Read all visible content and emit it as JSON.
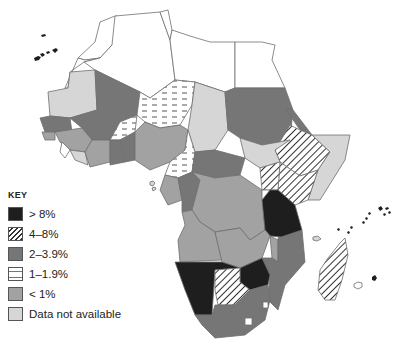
{
  "legend": {
    "title": "KEY",
    "items": [
      {
        "label": "> 8%",
        "pattern": "solid",
        "color": "#1e1e1e"
      },
      {
        "label": "4–8%",
        "pattern": "diagonal-hatch",
        "color": "#ffffff"
      },
      {
        "label": "2–3.9%",
        "pattern": "solid",
        "color": "#767676"
      },
      {
        "label": "1–1.9%",
        "pattern": "dashes",
        "color": "#ffffff"
      },
      {
        "label": "< 1%",
        "pattern": "solid",
        "color": "#a2a2a2"
      },
      {
        "label": "Data not available",
        "pattern": "solid",
        "color": "#d6d6d6"
      }
    ]
  },
  "colors": {
    "gt8": "#1e1e1e",
    "c2to39": "#767676",
    "lt1": "#a2a2a2",
    "na": "#d6d6d6",
    "none": "#ffffff",
    "border": "#6e6e6e"
  }
}
